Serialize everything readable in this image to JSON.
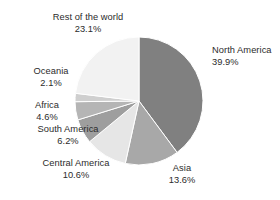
{
  "chart_data": {
    "type": "pie",
    "title": "",
    "subtitle": "",
    "xlabel": "",
    "ylabel": "",
    "legend_position": "none",
    "grid": false,
    "units": "percent",
    "start_angle_deg": 0,
    "direction": "clockwise",
    "categories": [
      "North America",
      "Asia",
      "Central America",
      "South America",
      "Africa",
      "Oceania",
      "Rest of the world"
    ],
    "values": [
      39.9,
      13.6,
      10.6,
      6.2,
      4.6,
      2.1,
      23.1
    ],
    "value_labels": [
      "39.9%",
      "13.6%",
      "10.6%",
      "6.2%",
      "4.6%",
      "2.1%",
      "23.1%"
    ],
    "colors": [
      "#808080",
      "#a8a8a8",
      "#e6e6e6",
      "#9e9e9e",
      "#b5b5b5",
      "#cfcfcf",
      "#f2f2f2"
    ],
    "slices": [
      {
        "label": "North America",
        "value": 39.9,
        "value_label": "39.9%",
        "color": "#808080"
      },
      {
        "label": "Asia",
        "value": 13.6,
        "value_label": "13.6%",
        "color": "#a8a8a8"
      },
      {
        "label": "Central America",
        "value": 10.6,
        "value_label": "10.6%",
        "color": "#e6e6e6"
      },
      {
        "label": "South America",
        "value": 6.2,
        "value_label": "6.2%",
        "color": "#9e9e9e"
      },
      {
        "label": "Africa",
        "value": 4.6,
        "value_label": "4.6%",
        "color": "#b5b5b5"
      },
      {
        "label": "Oceania",
        "value": 2.1,
        "value_label": "2.1%",
        "color": "#cfcfcf"
      },
      {
        "label": "Rest of the world",
        "value": 23.1,
        "value_label": "23.1%",
        "color": "#f2f2f2"
      }
    ]
  },
  "style": {
    "background": "#ffffff",
    "slice_border": "#ffffff",
    "label_color": "#2b2b2b"
  },
  "geometry": {
    "center_x": 139,
    "center_y": 101,
    "radius": 64
  }
}
